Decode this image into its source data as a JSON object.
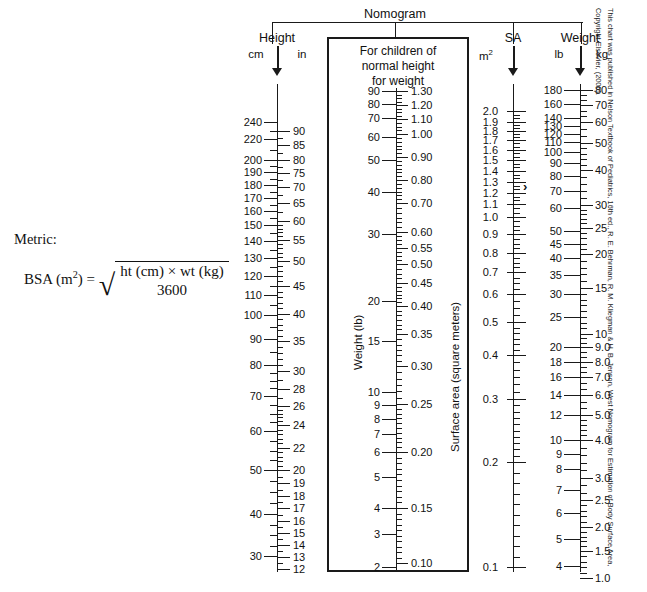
{
  "title": "Nomogram",
  "formula": {
    "metric_label": "Metric:",
    "lhs": "BSA (m",
    "lhs_sup": "2",
    "lhs_tail": ") =",
    "numerator": "ht (cm) × wt (kg)",
    "denominator": "3600"
  },
  "attribution": "This chart was published in Nelson Textbook of Pediatrics, 16th ed., R. E. Behrman, R. M. Kliegman & H. B. Jenson, West Nomogram for Estimation of Body Surface Area, Copyright Elsevier, (2000).",
  "height_column": {
    "title": "Height",
    "unit_left": "cm",
    "unit_right": "in",
    "cm_labels": [
      {
        "v": "240",
        "y": 122
      },
      {
        "v": "220",
        "y": 139
      },
      {
        "v": "200",
        "y": 160
      },
      {
        "v": "190",
        "y": 172
      },
      {
        "v": "180",
        "y": 185
      },
      {
        "v": "170",
        "y": 198
      },
      {
        "v": "160",
        "y": 211
      },
      {
        "v": "150",
        "y": 225
      },
      {
        "v": "140",
        "y": 241
      },
      {
        "v": "130",
        "y": 258
      },
      {
        "v": "120",
        "y": 276
      },
      {
        "v": "110",
        "y": 295
      },
      {
        "v": "100",
        "y": 315
      },
      {
        "v": "90",
        "y": 339
      },
      {
        "v": "80",
        "y": 365
      },
      {
        "v": "70",
        "y": 396
      },
      {
        "v": "60",
        "y": 431
      },
      {
        "v": "50",
        "y": 470
      },
      {
        "v": "40",
        "y": 514
      },
      {
        "v": "30",
        "y": 556
      }
    ],
    "in_labels": [
      {
        "v": "90",
        "y": 131
      },
      {
        "v": "85",
        "y": 145
      },
      {
        "v": "80",
        "y": 160
      },
      {
        "v": "75",
        "y": 173
      },
      {
        "v": "70",
        "y": 187
      },
      {
        "v": "65",
        "y": 203
      },
      {
        "v": "60",
        "y": 221
      },
      {
        "v": "55",
        "y": 240
      },
      {
        "v": "50",
        "y": 261
      },
      {
        "v": "45",
        "y": 286
      },
      {
        "v": "40",
        "y": 314
      },
      {
        "v": "35",
        "y": 341
      },
      {
        "v": "30",
        "y": 371
      },
      {
        "v": "28",
        "y": 389
      },
      {
        "v": "26",
        "y": 406
      },
      {
        "v": "24",
        "y": 425
      },
      {
        "v": "22",
        "y": 448
      },
      {
        "v": "20",
        "y": 470
      },
      {
        "v": "19",
        "y": 483
      },
      {
        "v": "18",
        "y": 496
      },
      {
        "v": "17",
        "y": 508
      },
      {
        "v": "16",
        "y": 521
      },
      {
        "v": "15",
        "y": 533
      },
      {
        "v": "14",
        "y": 545
      },
      {
        "v": "13",
        "y": 557
      },
      {
        "v": "12",
        "y": 569
      }
    ]
  },
  "center_box": {
    "heading_line1": "For children of",
    "heading_line2": "normal height",
    "heading_line3": "for weight",
    "left_axis_label": "Weight (lb)",
    "right_axis_label": "Surface area (square meters)",
    "weight_labels": [
      {
        "v": "90",
        "y": 91
      },
      {
        "v": "80",
        "y": 104
      },
      {
        "v": "70",
        "y": 118
      },
      {
        "v": "60",
        "y": 137
      },
      {
        "v": "50",
        "y": 160
      },
      {
        "v": "40",
        "y": 192
      },
      {
        "v": "30",
        "y": 234
      },
      {
        "v": "20",
        "y": 301
      },
      {
        "v": "15",
        "y": 341
      },
      {
        "v": "10",
        "y": 392
      },
      {
        "v": "9",
        "y": 405
      },
      {
        "v": "8",
        "y": 419
      },
      {
        "v": "7",
        "y": 434
      },
      {
        "v": "6",
        "y": 452
      },
      {
        "v": "5",
        "y": 477
      },
      {
        "v": "4",
        "y": 508
      },
      {
        "v": "3",
        "y": 534
      },
      {
        "v": "2",
        "y": 567
      }
    ],
    "sa_labels": [
      {
        "v": "1.30",
        "y": 91
      },
      {
        "v": "1.20",
        "y": 105
      },
      {
        "v": "1.10",
        "y": 119
      },
      {
        "v": "1.00",
        "y": 134
      },
      {
        "v": "0.90",
        "y": 157
      },
      {
        "v": "0.80",
        "y": 180
      },
      {
        "v": "0.70",
        "y": 203
      },
      {
        "v": "0.60",
        "y": 232
      },
      {
        "v": "0.55",
        "y": 248
      },
      {
        "v": "0.50",
        "y": 264
      },
      {
        "v": "0.45",
        "y": 283
      },
      {
        "v": "0.40",
        "y": 306
      },
      {
        "v": "0.35",
        "y": 334
      },
      {
        "v": "0.30",
        "y": 366
      },
      {
        "v": "0.25",
        "y": 404
      },
      {
        "v": "0.20",
        "y": 452
      },
      {
        "v": "0.15",
        "y": 508
      },
      {
        "v": "0.10",
        "y": 563
      }
    ]
  },
  "sa_column": {
    "title": "SA",
    "unit": "m",
    "unit_sup": "2",
    "marker": "›",
    "labels": [
      {
        "v": "2.0",
        "y": 111
      },
      {
        "v": "1.9",
        "y": 122
      },
      {
        "v": "1.8",
        "y": 131
      },
      {
        "v": "1.7",
        "y": 140
      },
      {
        "v": "1.6",
        "y": 150
      },
      {
        "v": "1.5",
        "y": 160
      },
      {
        "v": "1.4",
        "y": 171
      },
      {
        "v": "1.3",
        "y": 182
      },
      {
        "v": "1.2",
        "y": 193
      },
      {
        "v": "1.1",
        "y": 204
      },
      {
        "v": "1.0",
        "y": 217
      },
      {
        "v": "0.9",
        "y": 234
      },
      {
        "v": "0.8",
        "y": 253
      },
      {
        "v": "0.7",
        "y": 272
      },
      {
        "v": "0.6",
        "y": 294
      },
      {
        "v": "0.5",
        "y": 322
      },
      {
        "v": "0.4",
        "y": 355
      },
      {
        "v": "0.3",
        "y": 399
      },
      {
        "v": "0.2",
        "y": 462
      },
      {
        "v": "0.1",
        "y": 567
      }
    ]
  },
  "weight_column": {
    "title": "Weight",
    "unit_left": "lb",
    "unit_right": "kg",
    "lb_labels": [
      {
        "v": "180",
        "y": 90
      },
      {
        "v": "160",
        "y": 104
      },
      {
        "v": "140",
        "y": 118
      },
      {
        "v": "130",
        "y": 126
      },
      {
        "v": "120",
        "y": 134
      },
      {
        "v": "110",
        "y": 142
      },
      {
        "v": "100",
        "y": 152
      },
      {
        "v": "90",
        "y": 163
      },
      {
        "v": "80",
        "y": 176
      },
      {
        "v": "70",
        "y": 191
      },
      {
        "v": "60",
        "y": 208
      },
      {
        "v": "50",
        "y": 231
      },
      {
        "v": "45",
        "y": 244
      },
      {
        "v": "40",
        "y": 258
      },
      {
        "v": "35",
        "y": 275
      },
      {
        "v": "30",
        "y": 294
      },
      {
        "v": "25",
        "y": 317
      },
      {
        "v": "20",
        "y": 347
      },
      {
        "v": "18",
        "y": 362
      },
      {
        "v": "16",
        "y": 377
      },
      {
        "v": "14",
        "y": 395
      },
      {
        "v": "12",
        "y": 415
      },
      {
        "v": "10",
        "y": 440
      },
      {
        "v": "9",
        "y": 454
      },
      {
        "v": "8",
        "y": 469
      },
      {
        "v": "7",
        "y": 490
      },
      {
        "v": "6",
        "y": 513
      },
      {
        "v": "5",
        "y": 539
      },
      {
        "v": "4",
        "y": 566
      },
      {
        "v": "3",
        "y": 594
      }
    ],
    "kg_labels": [
      {
        "v": "80",
        "y": 90
      },
      {
        "v": "70",
        "y": 105
      },
      {
        "v": "60",
        "y": 122
      },
      {
        "v": "50",
        "y": 143
      },
      {
        "v": "40",
        "y": 170
      },
      {
        "v": "30",
        "y": 205
      },
      {
        "v": "25",
        "y": 228
      },
      {
        "v": "20",
        "y": 254
      },
      {
        "v": "15",
        "y": 288
      },
      {
        "v": "10",
        "y": 334
      },
      {
        "v": "9.0",
        "y": 347
      },
      {
        "v": "8.0",
        "y": 362
      },
      {
        "v": "7.0",
        "y": 377
      },
      {
        "v": "6.0",
        "y": 395
      },
      {
        "v": "5.0",
        "y": 415
      },
      {
        "v": "4.0",
        "y": 440
      },
      {
        "v": "3.0",
        "y": 478
      },
      {
        "v": "2.5",
        "y": 500
      },
      {
        "v": "2.0",
        "y": 527
      },
      {
        "v": "1.5",
        "y": 551
      },
      {
        "v": "1.0",
        "y": 578
      }
    ]
  }
}
